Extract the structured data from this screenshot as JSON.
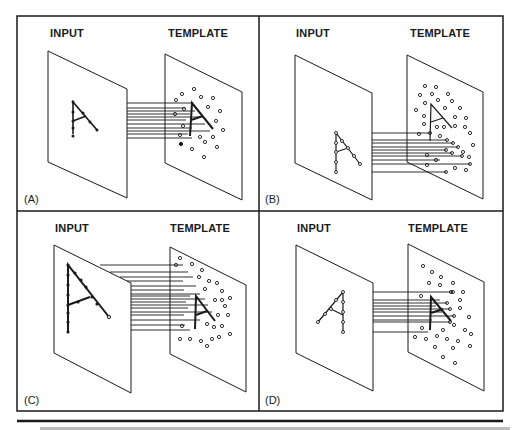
{
  "figure": {
    "rule_color": "#1a1a1a",
    "panels": [
      {
        "id": "A",
        "label": "(A)",
        "input_label": "INPUT",
        "template_label": "TEMPLATE",
        "note": "input A same size/position as template A"
      },
      {
        "id": "B",
        "label": "(B)",
        "input_label": "INPUT",
        "template_label": "TEMPLATE",
        "note": "input A displaced, misaligned with template"
      },
      {
        "id": "C",
        "label": "(C)",
        "input_label": "INPUT",
        "template_label": "TEMPLATE",
        "note": "input A larger than template"
      },
      {
        "id": "D",
        "label": "(D)",
        "input_label": "INPUT",
        "template_label": "TEMPLATE",
        "note": "input A mirrored/rotated relative to template"
      }
    ],
    "caption": ""
  }
}
